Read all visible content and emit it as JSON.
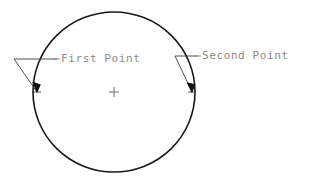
{
  "diagram": {
    "type": "cad-circle-annotation",
    "background_color": "#ffffff",
    "stroke_color": "#1a1a1a",
    "leader_color": "#3c3c3c",
    "text_color": "#8a8a8a",
    "circle": {
      "center_x": 114,
      "center_y": 92,
      "radius_x": 81,
      "radius_y": 80,
      "stroke_width": 1.6
    },
    "center_mark": {
      "x": 114,
      "y": 92,
      "size": 5,
      "symbol": "+"
    },
    "annotations": [
      {
        "id": "first-point",
        "label": "First Point",
        "label_x": 60,
        "label_y": 59,
        "dash_x1": 54,
        "dash_x2": 59,
        "leader_horizontal": {
          "x1": 14,
          "y1": 59,
          "x2": 57,
          "y2": 59
        },
        "leader_diagonal": {
          "x1": 14,
          "y1": 59,
          "x2": 37,
          "y2": 92
        },
        "arrow_tip": {
          "x": 37,
          "y": 92
        },
        "tick": {
          "x": 37,
          "y": 92,
          "size": 4
        }
      },
      {
        "id": "second-point",
        "label": "Second Point",
        "label_x": 201,
        "label_y": 56,
        "dash_x1": 195,
        "dash_x2": 200,
        "leader_horizontal": {
          "x1": 175,
          "y1": 56,
          "x2": 198,
          "y2": 56
        },
        "leader_diagonal": {
          "x1": 175,
          "y1": 56,
          "x2": 192,
          "y2": 92
        },
        "arrow_tip": {
          "x": 192,
          "y": 92
        },
        "tick": {
          "x": 192,
          "y": 92,
          "size": 4
        }
      }
    ]
  }
}
